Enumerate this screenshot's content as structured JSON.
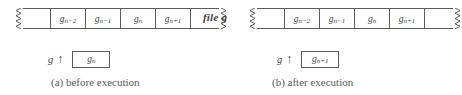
{
  "figure": {
    "file_label": "file g",
    "pointer_arrow_glyph": "↑",
    "colors": {
      "background": "#ffffff",
      "ink": "#3d3d3d",
      "rule": "#5a5a5a",
      "caption": "#585858"
    }
  },
  "panel_a": {
    "caption": "(a) before execution",
    "buffer": {
      "left_edge": "torn-edge-zigzag",
      "right_edge": "torn-edge-zigzag",
      "cells": [
        {
          "label": "",
          "type": "pad"
        },
        {
          "label": "g",
          "sub": "n−2",
          "type": "data"
        },
        {
          "label": "g",
          "sub": "n−1",
          "type": "data"
        },
        {
          "label": "g",
          "sub": "n",
          "type": "data"
        },
        {
          "label": "g",
          "sub": "n+1",
          "type": "data"
        },
        {
          "label": "",
          "type": "pad"
        }
      ]
    },
    "pointer": {
      "name": "g",
      "arrow": "↑",
      "value_label": "g",
      "value_sub": "n"
    }
  },
  "panel_b": {
    "caption": "(b) after execution",
    "buffer": {
      "left_edge": "torn-edge-zigzag",
      "right_edge": "torn-edge-zigzag",
      "cells": [
        {
          "label": "",
          "type": "pad"
        },
        {
          "label": "g",
          "sub": "n−2",
          "type": "data"
        },
        {
          "label": "g",
          "sub": "n−1",
          "type": "data"
        },
        {
          "label": "g",
          "sub": "n",
          "type": "data"
        },
        {
          "label": "g",
          "sub": "n+1",
          "type": "data"
        },
        {
          "label": "",
          "type": "pad"
        }
      ]
    },
    "pointer": {
      "name": "g",
      "arrow": "↑",
      "value_label": "g",
      "value_sub": "n+1"
    }
  }
}
